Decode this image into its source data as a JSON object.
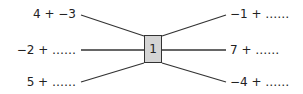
{
  "center": {
    "value": "1"
  },
  "left": [
    {
      "text": "4 + −3"
    },
    {
      "text": "−2 + ……"
    },
    {
      "text": "5 + ……"
    }
  ],
  "right": [
    {
      "text": "−1 + ……"
    },
    {
      "text": "7 + ……"
    },
    {
      "text": "−4 + ……"
    }
  ],
  "colors": {
    "box_fill": "#d4d4d4",
    "line": "#333333"
  }
}
